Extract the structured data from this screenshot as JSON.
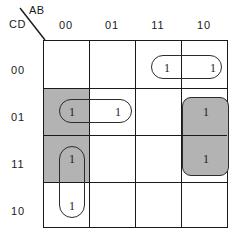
{
  "diagram": {
    "type": "karnaugh-map",
    "variables_top": "AB",
    "variables_left": "CD",
    "col_headers": [
      "00",
      "01",
      "11",
      "10"
    ],
    "row_headers": [
      "00",
      "01",
      "11",
      "10"
    ],
    "cell_value": "1",
    "colors": {
      "shade": "#b3b3b3",
      "line": "#1a1a1a",
      "group_outline": "#2b2b2b"
    },
    "cells": [
      {
        "row": "00",
        "col": "00",
        "value": "",
        "shaded": false
      },
      {
        "row": "00",
        "col": "01",
        "value": "",
        "shaded": false
      },
      {
        "row": "00",
        "col": "11",
        "value": "1",
        "shaded": false
      },
      {
        "row": "00",
        "col": "10",
        "value": "1",
        "shaded": false
      },
      {
        "row": "01",
        "col": "00",
        "value": "1",
        "shaded": true
      },
      {
        "row": "01",
        "col": "01",
        "value": "1",
        "shaded": false
      },
      {
        "row": "01",
        "col": "11",
        "value": "",
        "shaded": false
      },
      {
        "row": "01",
        "col": "10",
        "value": "1",
        "shaded": true
      },
      {
        "row": "11",
        "col": "00",
        "value": "1",
        "shaded": true
      },
      {
        "row": "11",
        "col": "01",
        "value": "",
        "shaded": false
      },
      {
        "row": "11",
        "col": "11",
        "value": "",
        "shaded": false
      },
      {
        "row": "11",
        "col": "10",
        "value": "1",
        "shaded": true
      },
      {
        "row": "10",
        "col": "00",
        "value": "1",
        "shaded": false
      },
      {
        "row": "10",
        "col": "01",
        "value": "",
        "shaded": false
      },
      {
        "row": "10",
        "col": "11",
        "value": "",
        "shaded": false
      },
      {
        "row": "10",
        "col": "10",
        "value": "",
        "shaded": false
      }
    ],
    "groups": [
      {
        "name": "group-top-right",
        "orientation": "horizontal",
        "cells": [
          "00-11",
          "00-10"
        ],
        "shaded": false
      },
      {
        "name": "group-mid-left",
        "orientation": "horizontal",
        "cells": [
          "01-00",
          "01-01"
        ],
        "shaded": false
      },
      {
        "name": "group-lower-left",
        "orientation": "vertical",
        "cells": [
          "11-00",
          "10-00"
        ],
        "shaded": false
      },
      {
        "name": "group-right-column",
        "orientation": "vertical",
        "cells": [
          "01-10",
          "11-10"
        ],
        "shaded": true
      }
    ]
  }
}
